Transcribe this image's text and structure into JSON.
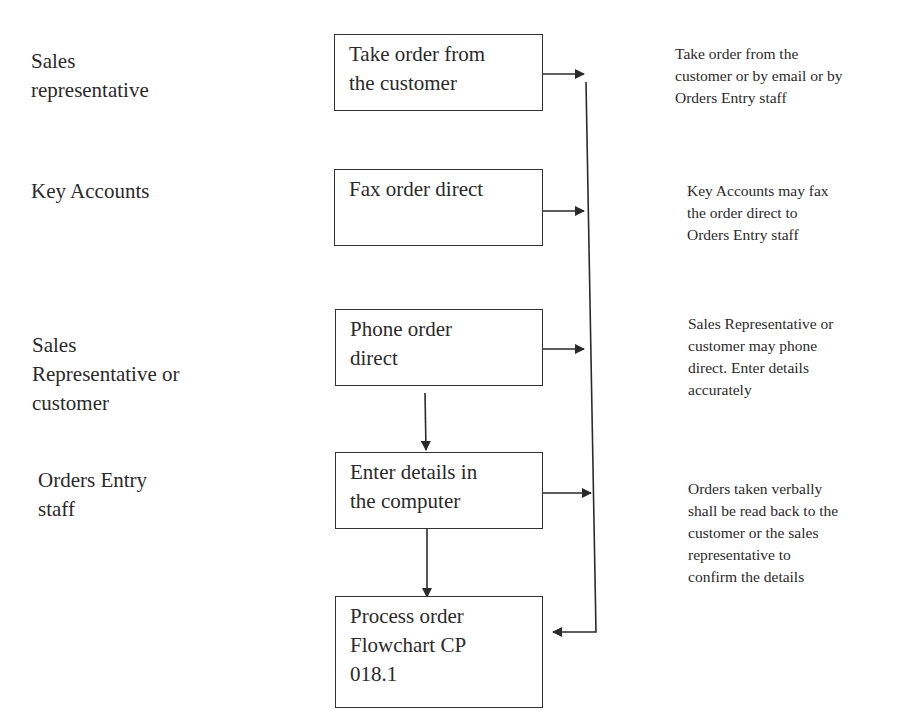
{
  "actors": [
    {
      "id": "sales-rep",
      "label": "Sales\nrepresentative"
    },
    {
      "id": "key-accounts",
      "label": "Key Accounts"
    },
    {
      "id": "sales-rep-or-customer",
      "label": "Sales\nRepresentative or\ncustomer"
    },
    {
      "id": "orders-entry-staff",
      "label": "Orders Entry\nstaff"
    }
  ],
  "steps": [
    {
      "id": "take-order",
      "label": "Take order from\nthe customer"
    },
    {
      "id": "fax-order",
      "label": "Fax order direct"
    },
    {
      "id": "phone-order",
      "label": "Phone order\ndirect"
    },
    {
      "id": "enter-details",
      "label": "Enter details in\nthe computer"
    },
    {
      "id": "process-order",
      "label": "Process order\nFlowchart CP\n018.1"
    }
  ],
  "notes": [
    {
      "id": "note-take-order",
      "text": "Take order from the\ncustomer or by email or by\nOrders Entry staff"
    },
    {
      "id": "note-fax-order",
      "text": "Key Accounts may fax\nthe order direct to\nOrders Entry staff"
    },
    {
      "id": "note-phone-order",
      "text": "Sales Representative or\ncustomer may phone\ndirect. Enter details\naccurately"
    },
    {
      "id": "note-enter-details",
      "text": "Orders taken verbally\nshall be read back to the\ncustomer or the sales\nrepresentative to\nconfirm the details"
    }
  ],
  "colors": {
    "line": "#2a2a2a",
    "background": "#ffffff"
  }
}
